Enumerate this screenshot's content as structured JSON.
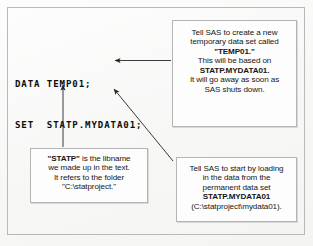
{
  "figure": {
    "code": {
      "line1": "DATA TEMP01;",
      "line2": "SET  STATP.MYDATA01;"
    },
    "callouts": {
      "create": {
        "line1": "Tell SAS to create a new",
        "line2": "temporary data set called",
        "line3": "\"TEMP01.\"",
        "line4": "This will be based on",
        "line5": "STATP.MYDATA01.",
        "line6": "It will go away as soon as",
        "line7": "SAS shuts down."
      },
      "load": {
        "line1": "Tell SAS to start by loading",
        "line2": "in the data from the",
        "line3": "permanent data set",
        "line4": "STATP.MYDATA01",
        "line5": "(C:\\statproject\\mydata01)."
      },
      "libname": {
        "line1_bold": "\"STATP\"",
        "line1_rest": " is the libname",
        "line2": "we made up in the text.",
        "line3": "It refers to the folder",
        "line4": "\"C:\\statproject.\""
      }
    },
    "arrows": {
      "create_to_data": "arrow-left",
      "libname_to_statp": "arrow-up",
      "load_to_mydata": "arrow-up-left"
    },
    "colors": {
      "ink": "#161616",
      "border": "#b4b4b4",
      "paper": "#fbfbfa"
    }
  }
}
